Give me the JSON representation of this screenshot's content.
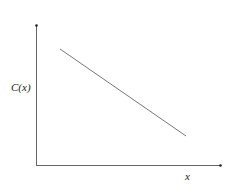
{
  "diagram": {
    "y_axis_label": "C(x)",
    "x_axis_label": "x",
    "line": {
      "description": "decreasing linear function",
      "start": [
        60,
        49
      ],
      "end": [
        186,
        136
      ]
    },
    "colors": {
      "axis": "#555555",
      "line": "#777777"
    }
  }
}
